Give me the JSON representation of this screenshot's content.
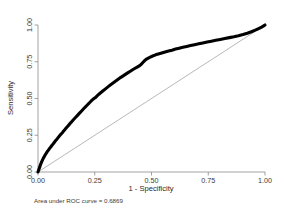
{
  "chart_data": {
    "type": "line",
    "title": "",
    "xlabel": "1 - Specificity",
    "ylabel": "Sensitivity",
    "xlim": [
      0,
      1
    ],
    "ylim": [
      0,
      1
    ],
    "grid": false,
    "legend": "none",
    "annotation": "Area under ROC curve = 0.6869",
    "auc": 0.6869,
    "xticks": [
      "0.00",
      "0.25",
      "0.50",
      "0.75",
      "1.00"
    ],
    "xtick_values": [
      0.0,
      0.25,
      0.5,
      0.75,
      1.0
    ],
    "yticks": [
      "0.00",
      "0.25",
      "0.50",
      "0.75",
      "1.00"
    ],
    "ytick_values": [
      0.0,
      0.25,
      0.5,
      0.75,
      1.0
    ],
    "series": [
      {
        "name": "ROC curve",
        "color": "#000000",
        "x": [
          0.0,
          0.004,
          0.008,
          0.01,
          0.013,
          0.016,
          0.018,
          0.021,
          0.024,
          0.027,
          0.03,
          0.034,
          0.038,
          0.041,
          0.045,
          0.049,
          0.053,
          0.057,
          0.061,
          0.065,
          0.069,
          0.073,
          0.077,
          0.082,
          0.086,
          0.09,
          0.095,
          0.099,
          0.104,
          0.109,
          0.113,
          0.118,
          0.123,
          0.128,
          0.133,
          0.138,
          0.143,
          0.149,
          0.154,
          0.16,
          0.166,
          0.172,
          0.178,
          0.184,
          0.19,
          0.196,
          0.202,
          0.209,
          0.216,
          0.223,
          0.23,
          0.237,
          0.244,
          0.251,
          0.252,
          0.258,
          0.265,
          0.272,
          0.28,
          0.288,
          0.296,
          0.304,
          0.312,
          0.32,
          0.329,
          0.338,
          0.347,
          0.356,
          0.365,
          0.375,
          0.385,
          0.395,
          0.405,
          0.415,
          0.426,
          0.437,
          0.448,
          0.455,
          0.462,
          0.47,
          0.48,
          0.492,
          0.505,
          0.518,
          0.53,
          0.545,
          0.56,
          0.575,
          0.59,
          0.606,
          0.622,
          0.638,
          0.655,
          0.672,
          0.69,
          0.708,
          0.726,
          0.745,
          0.764,
          0.783,
          0.803,
          0.823,
          0.843,
          0.863,
          0.883,
          0.903,
          0.922,
          0.94,
          0.957,
          0.972,
          0.985,
          0.994,
          1.0
        ],
        "y": [
          0.0,
          0.018,
          0.035,
          0.046,
          0.058,
          0.068,
          0.076,
          0.086,
          0.095,
          0.103,
          0.112,
          0.122,
          0.131,
          0.139,
          0.147,
          0.156,
          0.164,
          0.172,
          0.18,
          0.188,
          0.196,
          0.204,
          0.212,
          0.221,
          0.229,
          0.237,
          0.246,
          0.254,
          0.262,
          0.271,
          0.279,
          0.288,
          0.297,
          0.306,
          0.315,
          0.324,
          0.333,
          0.343,
          0.352,
          0.362,
          0.372,
          0.382,
          0.392,
          0.402,
          0.412,
          0.422,
          0.432,
          0.443,
          0.454,
          0.465,
          0.476,
          0.487,
          0.497,
          0.505,
          0.505,
          0.514,
          0.524,
          0.534,
          0.544,
          0.554,
          0.564,
          0.574,
          0.584,
          0.594,
          0.604,
          0.614,
          0.624,
          0.634,
          0.644,
          0.654,
          0.664,
          0.674,
          0.684,
          0.694,
          0.704,
          0.714,
          0.724,
          0.733,
          0.745,
          0.758,
          0.77,
          0.78,
          0.789,
          0.797,
          0.803,
          0.81,
          0.817,
          0.823,
          0.829,
          0.836,
          0.842,
          0.848,
          0.854,
          0.86,
          0.866,
          0.872,
          0.878,
          0.884,
          0.89,
          0.896,
          0.902,
          0.908,
          0.914,
          0.92,
          0.927,
          0.935,
          0.944,
          0.954,
          0.965,
          0.976,
          0.986,
          0.994,
          1.0
        ]
      },
      {
        "name": "Reference line",
        "color": "#9a9a9a",
        "x": [
          0.0,
          1.0
        ],
        "y": [
          0.0,
          1.0
        ]
      }
    ]
  },
  "figure": {
    "caption": "Area under ROC curve = 0.6869",
    "xlabel": "1 - Specificity",
    "ylabel": "Sensitivity"
  }
}
